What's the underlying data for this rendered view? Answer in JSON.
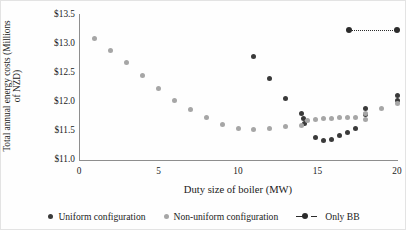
{
  "chart_data": {
    "type": "scatter",
    "title": "",
    "xlabel": "Duty size of boiler (MW)",
    "ylabel_line1": "Total annual energy costs (Millions",
    "ylabel_line2": "of NZD)",
    "xlim": [
      0,
      20
    ],
    "ylim": [
      11.0,
      13.5
    ],
    "xticks": [
      0,
      5,
      10,
      15,
      20
    ],
    "xtick_labels": [
      "0",
      "5",
      "10",
      "15",
      "20"
    ],
    "yticks": [
      11.0,
      11.5,
      12.0,
      12.5,
      13.0,
      13.5
    ],
    "ytick_labels": [
      "$11.0",
      "$11.5",
      "$12.0",
      "$12.5",
      "$13.0",
      "$13.5"
    ],
    "grid": false,
    "legend_position": "bottom",
    "colors": {
      "uniform": "#3a3a3a",
      "non_uniform": "#a6a6a6",
      "only_bb": "#2b2b2b",
      "axis": "#8e8e8e",
      "background": "#ffffff"
    },
    "series": [
      {
        "name": "Uniform configuration",
        "marker": "circle",
        "color": "#3a3a3a",
        "points": [
          [
            11.0,
            12.79
          ],
          [
            12.0,
            12.41
          ],
          [
            13.0,
            12.06
          ],
          [
            14.0,
            11.8
          ],
          [
            14.1,
            11.72
          ],
          [
            14.2,
            11.63
          ],
          [
            14.9,
            11.38
          ],
          [
            15.4,
            11.33
          ],
          [
            15.9,
            11.36
          ],
          [
            16.4,
            11.42
          ],
          [
            16.9,
            11.48
          ],
          [
            17.4,
            11.55
          ],
          [
            18.0,
            11.78
          ],
          [
            18.0,
            11.88
          ],
          [
            20.0,
            12.02
          ],
          [
            20.0,
            12.12
          ]
        ]
      },
      {
        "name": "Non-uniform configuration",
        "marker": "circle",
        "color": "#a6a6a6",
        "points": [
          [
            1.0,
            13.1
          ],
          [
            2.0,
            12.88
          ],
          [
            3.0,
            12.68
          ],
          [
            4.0,
            12.45
          ],
          [
            5.0,
            12.23
          ],
          [
            6.0,
            12.03
          ],
          [
            7.0,
            11.87
          ],
          [
            8.0,
            11.73
          ],
          [
            9.0,
            11.62
          ],
          [
            10.0,
            11.55
          ],
          [
            11.0,
            11.52
          ],
          [
            12.0,
            11.55
          ],
          [
            13.0,
            11.57
          ],
          [
            14.0,
            11.6
          ],
          [
            14.4,
            11.68
          ],
          [
            14.9,
            11.7
          ],
          [
            15.4,
            11.71
          ],
          [
            15.9,
            11.72
          ],
          [
            16.4,
            11.73
          ],
          [
            16.9,
            11.74
          ],
          [
            17.4,
            11.73
          ],
          [
            18.0,
            11.7
          ],
          [
            18.0,
            11.8
          ],
          [
            19.0,
            11.88
          ],
          [
            20.0,
            11.97
          ]
        ]
      },
      {
        "name": "Only BB",
        "marker": "circle-dotted-line",
        "color": "#2b2b2b",
        "points": [
          [
            17.0,
            13.25
          ],
          [
            20.0,
            13.25
          ]
        ]
      }
    ]
  },
  "legend": {
    "items": [
      {
        "label": "Uniform configuration",
        "style": "dot-dark"
      },
      {
        "label": "Non-uniform configuration",
        "style": "dot-gray"
      },
      {
        "label": "Only BB",
        "style": "dotted-line-marker"
      }
    ]
  }
}
